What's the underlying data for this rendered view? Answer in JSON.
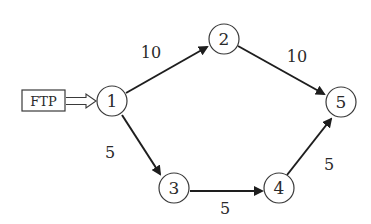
{
  "diagram": {
    "type": "directed-graph",
    "source_box": {
      "label": "FTP"
    },
    "nodes": [
      {
        "id": "1",
        "label": "1"
      },
      {
        "id": "2",
        "label": "2"
      },
      {
        "id": "3",
        "label": "3"
      },
      {
        "id": "4",
        "label": "4"
      },
      {
        "id": "5",
        "label": "5"
      }
    ],
    "edges": [
      {
        "from": "FTP",
        "to": "1",
        "label": ""
      },
      {
        "from": "1",
        "to": "2",
        "label": "10"
      },
      {
        "from": "2",
        "to": "5",
        "label": "10"
      },
      {
        "from": "1",
        "to": "3",
        "label": "5"
      },
      {
        "from": "3",
        "to": "4",
        "label": "5"
      },
      {
        "from": "4",
        "to": "5",
        "label": "5"
      }
    ]
  }
}
